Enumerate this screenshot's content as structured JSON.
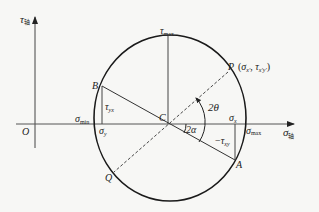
{
  "diagram": {
    "axes": {
      "tau_axis": {
        "symbol": "τ",
        "suffix": "轴"
      },
      "sigma_axis": {
        "symbol": "σ",
        "suffix": "轴"
      },
      "origin": "O"
    },
    "points": {
      "B": "B",
      "A": "A",
      "C": "C",
      "P": "P",
      "Q": "Q"
    },
    "labels": {
      "tau_max": {
        "symbol": "τ",
        "sub": "max"
      },
      "sigma_min": {
        "symbol": "σ",
        "sub": "min"
      },
      "sigma_max": {
        "symbol": "σ",
        "sub": "max"
      },
      "sigma_y": {
        "symbol": "σ",
        "sub": "y"
      },
      "sigma_x": {
        "symbol": "σ",
        "sub": "x"
      },
      "tau_yx": {
        "symbol": "τ",
        "sub": "yx"
      },
      "neg_tau_xy": {
        "prefix": "−",
        "symbol": "τ",
        "sub": "xy"
      },
      "P_coords": "(σx′, τx′y′)",
      "P_coords_parts": {
        "open": "(",
        "s": "σ",
        "s_sub": "x′",
        "sep": ", ",
        "t": "τ",
        "t_sub": "x′y′",
        "close": ")"
      },
      "angle_2theta": "2θ",
      "angle_2alpha": "2α"
    },
    "colors": {
      "line": "#222222",
      "axis": "#555555",
      "background": "#f7f7f5"
    }
  }
}
